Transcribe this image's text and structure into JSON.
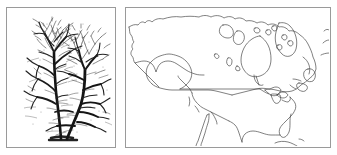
{
  "figure": {
    "background_color": "#ffffff",
    "panel_count": 2,
    "panel_border_color": "#9a9a9a",
    "ink_color": "#1a1a1a"
  },
  "panels": [
    {
      "id": "tree-panel",
      "position": "left",
      "type": "photograph",
      "subject": "bare deciduous tree",
      "alt_text": "Black and white photograph of a leafless multi-stemmed deciduous tree with dense fine twig branching against a white sky",
      "rendering": "grayscale halftone",
      "frame": {
        "x": 6,
        "y": 7,
        "width": 110,
        "height": 141
      },
      "features": [
        "two main crowns",
        "multi-stem trunk splitting near base",
        "dense fine twigs",
        "no foliage"
      ]
    },
    {
      "id": "map-panel",
      "position": "right",
      "type": "outline-map",
      "subject": "North America",
      "alt_text": "Unlabeled outline map of North America showing Alaska, Canada, the contiguous United States and northern Mexico with Hudson Bay, Baffin Island, the Great Lakes, Baja California and Florida",
      "rendering": "line drawing, no fill, no labels",
      "frame": {
        "x": 125,
        "y": 7,
        "width": 206,
        "height": 141
      },
      "features": [
        "Alaska",
        "Canada",
        "United States",
        "northern Mexico",
        "Baja California",
        "Gulf of California",
        "Gulf of Mexico",
        "Florida peninsula",
        "Hudson Bay",
        "Baffin Island",
        "Banks Island",
        "Victoria Island",
        "Great Lakes",
        "Newfoundland",
        "Nova Scotia",
        "Cuba"
      ],
      "labels": [],
      "legend": null
    }
  ]
}
